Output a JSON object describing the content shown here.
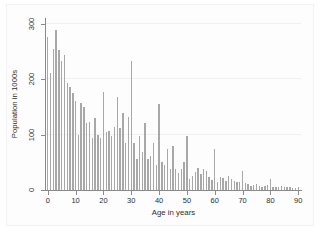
{
  "chart_data": {
    "type": "bar",
    "title": "",
    "xlabel": "Age in years",
    "ylabel": "Population in 1000s",
    "xlim": [
      -1,
      91
    ],
    "ylim": [
      0,
      310
    ],
    "grid": true,
    "legend": null,
    "xticks": [
      0,
      10,
      20,
      30,
      40,
      50,
      60,
      70,
      80,
      90
    ],
    "yticks": [
      0,
      100,
      200,
      300
    ],
    "bar_color": "#a8a8a8",
    "categories": [
      0,
      1,
      2,
      3,
      4,
      5,
      6,
      7,
      8,
      9,
      10,
      11,
      12,
      13,
      14,
      15,
      16,
      17,
      18,
      19,
      20,
      21,
      22,
      23,
      24,
      25,
      26,
      27,
      28,
      29,
      30,
      31,
      32,
      33,
      34,
      35,
      36,
      37,
      38,
      39,
      40,
      41,
      42,
      43,
      44,
      45,
      46,
      47,
      48,
      49,
      50,
      51,
      52,
      53,
      54,
      55,
      56,
      57,
      58,
      59,
      60,
      61,
      62,
      63,
      64,
      65,
      66,
      67,
      68,
      69,
      70,
      71,
      72,
      73,
      74,
      75,
      76,
      77,
      78,
      79,
      80,
      81,
      82,
      83,
      84,
      85,
      86,
      87,
      88,
      89,
      90
    ],
    "values": [
      276,
      210,
      255,
      289,
      253,
      233,
      243,
      192,
      185,
      175,
      160,
      100,
      157,
      150,
      120,
      123,
      93,
      130,
      100,
      93,
      177,
      105,
      107,
      98,
      114,
      168,
      111,
      138,
      84,
      131,
      232,
      85,
      56,
      97,
      68,
      121,
      56,
      61,
      84,
      45,
      155,
      51,
      45,
      74,
      37,
      80,
      38,
      31,
      38,
      51,
      98,
      20,
      26,
      32,
      40,
      29,
      37,
      35,
      24,
      18,
      74,
      14,
      24,
      21,
      17,
      26,
      19,
      16,
      14,
      15,
      35,
      12,
      11,
      8,
      9,
      11,
      7,
      6,
      7,
      9,
      19,
      5,
      6,
      5,
      7,
      6,
      5,
      6,
      4,
      4,
      6
    ]
  }
}
